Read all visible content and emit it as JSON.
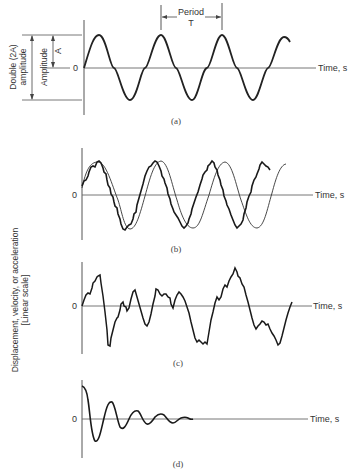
{
  "figure": {
    "y_axis_label_line1": "Displacement, velocity, or acceleration",
    "y_axis_label_line2": "[Linear scale]",
    "colors": {
      "ink": "#222222",
      "axis": "#555555",
      "text": "#333333",
      "background": "#ffffff"
    }
  },
  "panels": [
    {
      "id": "a",
      "caption": "(a)",
      "zero_label": "0",
      "time_label": "Time, s",
      "description": "Pure sinusoid",
      "annotations": {
        "period_label": "Period",
        "period_symbol": "T",
        "amplitude_label": "Amplitude",
        "amplitude_symbol": "A",
        "double_amplitude_line1": "Double (2A)",
        "double_amplitude_line2": "amplitude"
      }
    },
    {
      "id": "b",
      "caption": "(b)",
      "zero_label": "0",
      "time_label": "Time, s",
      "description": "Periodic signal with superimposed higher-frequency ripple"
    },
    {
      "id": "c",
      "caption": "(c)",
      "zero_label": "0",
      "time_label": "Time, s",
      "description": "Random (non-periodic) signal"
    },
    {
      "id": "d",
      "caption": "(d)",
      "zero_label": "0",
      "time_label": "Time, s",
      "description": "Damped decaying oscillation"
    }
  ]
}
